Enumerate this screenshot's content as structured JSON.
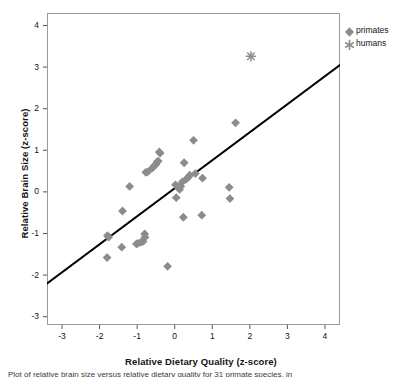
{
  "chart_data": {
    "type": "scatter",
    "title": "",
    "xlabel": "Relative Dietary Quality (z-score)",
    "ylabel": "Relative Brain Size (z-score)",
    "xlim": [
      -3.4,
      4.4
    ],
    "ylim": [
      -3.2,
      4.3
    ],
    "grid": false,
    "legend_position": "right-top",
    "xticks": [
      -3,
      -2,
      -1,
      0,
      1,
      2,
      3,
      4
    ],
    "xtick_labels": [
      "-3",
      "-2",
      "-1",
      "0",
      "1",
      "2",
      "3",
      "4"
    ],
    "yticks": [
      -3,
      -2,
      -1,
      0,
      1,
      2,
      3,
      4
    ],
    "ytick_labels": [
      "-3",
      "-2",
      "-1",
      "0",
      "1",
      "2",
      "3",
      "4"
    ],
    "marker_color": "#8c8c8c",
    "line_color": "#000000",
    "series": [
      {
        "name": "primates",
        "marker": "diamond",
        "color": "#8c8c8c",
        "points": [
          [
            -1.79,
            -1.05
          ],
          [
            -1.76,
            -1.09
          ],
          [
            -1.8,
            -1.58
          ],
          [
            -1.41,
            -1.33
          ],
          [
            -1.39,
            -0.46
          ],
          [
            -1.2,
            0.13
          ],
          [
            -1.02,
            -1.25
          ],
          [
            -0.98,
            -1.24
          ],
          [
            -0.9,
            -1.21
          ],
          [
            -0.84,
            -1.19
          ],
          [
            -0.8,
            -1.01
          ],
          [
            -0.79,
            -1.09
          ],
          [
            -0.77,
            0.47
          ],
          [
            -0.72,
            0.48
          ],
          [
            -0.6,
            0.57
          ],
          [
            -0.55,
            0.62
          ],
          [
            -0.5,
            0.66
          ],
          [
            -0.47,
            0.72
          ],
          [
            -0.44,
            0.74
          ],
          [
            -0.41,
            0.96
          ],
          [
            -0.39,
            0.93
          ],
          [
            -0.19,
            -1.79
          ],
          [
            0.02,
            0.17
          ],
          [
            0.04,
            -0.14
          ],
          [
            0.1,
            0.1
          ],
          [
            0.13,
            0.06
          ],
          [
            0.16,
            0.13
          ],
          [
            0.2,
            0.24
          ],
          [
            0.23,
            -0.61
          ],
          [
            0.25,
            0.7
          ],
          [
            0.3,
            0.3
          ],
          [
            0.36,
            0.35
          ],
          [
            0.4,
            0.4
          ],
          [
            0.5,
            1.24
          ],
          [
            0.55,
            0.44
          ],
          [
            0.72,
            -0.56
          ],
          [
            0.74,
            0.33
          ],
          [
            1.45,
            0.11
          ],
          [
            1.47,
            -0.16
          ],
          [
            1.62,
            1.66
          ]
        ]
      },
      {
        "name": "humans",
        "marker": "asterisk",
        "color": "#8c8c8c",
        "points": [
          [
            2.03,
            3.26
          ]
        ]
      }
    ],
    "fit_line": {
      "name": "regression-line",
      "x_start": -3.4,
      "y_start": -2.2,
      "x_end": 4.4,
      "y_end": 3.05
    },
    "legend": [
      {
        "label": "primates",
        "marker": "diamond"
      },
      {
        "label": "humans",
        "marker": "asterisk"
      }
    ]
  },
  "caption": "Plot of relative brain size versus relative dietary quality for 31 primate species, in"
}
